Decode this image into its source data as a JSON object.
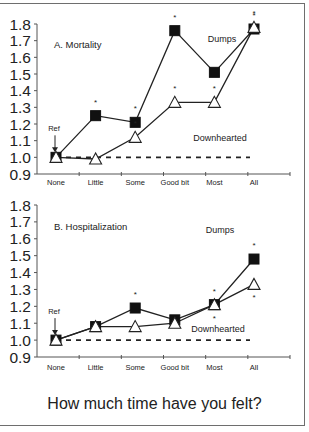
{
  "chart_data": [
    {
      "type": "line",
      "title": "A. Mortality",
      "categories": [
        "None",
        "Little",
        "Some",
        "Good bit",
        "Most",
        "All"
      ],
      "series": [
        {
          "name": "Dumps",
          "marker": "filled-square",
          "values": [
            1.0,
            1.25,
            1.21,
            1.76,
            1.51,
            1.77
          ],
          "significant": [
            false,
            true,
            true,
            true,
            false,
            true
          ]
        },
        {
          "name": "Downhearted",
          "marker": "open-triangle",
          "values": [
            1.0,
            0.99,
            1.12,
            1.33,
            1.33,
            1.78
          ],
          "significant": [
            false,
            false,
            true,
            true,
            true,
            true
          ]
        }
      ],
      "reference_line": 1.0,
      "reference_label": "Ref",
      "xlabel": "",
      "ylabel": "",
      "yticks": [
        "0.9",
        "1.0",
        "1.1",
        "1.2",
        "1.3",
        "1.4",
        "1.5",
        "1.6",
        "1.7",
        "1.8"
      ],
      "ylim": [
        0.9,
        1.8
      ],
      "annotations": [
        "Dumps",
        "Downhearted",
        "Ref"
      ],
      "grid": false
    },
    {
      "type": "line",
      "title": "B. Hospitalization",
      "categories": [
        "None",
        "Little",
        "Some",
        "Good bit",
        "Most",
        "All"
      ],
      "series": [
        {
          "name": "Dumps",
          "marker": "filled-square",
          "values": [
            1.0,
            1.08,
            1.19,
            1.12,
            1.21,
            1.48
          ],
          "significant": [
            false,
            false,
            true,
            false,
            true,
            true
          ]
        },
        {
          "name": "Downhearted",
          "marker": "open-triangle",
          "values": [
            1.0,
            1.08,
            1.08,
            1.1,
            1.21,
            1.33
          ],
          "significant": [
            false,
            false,
            false,
            false,
            true,
            true
          ]
        }
      ],
      "reference_line": 1.0,
      "reference_label": "Ref",
      "xlabel": "",
      "ylabel": "",
      "yticks": [
        "0.9",
        "1.0",
        "1.1",
        "1.2",
        "1.3",
        "1.4",
        "1.5",
        "1.6",
        "1.7",
        "1.8"
      ],
      "ylim": [
        0.9,
        1.8
      ],
      "annotations": [
        "Dumps",
        "Downhearted",
        "Ref"
      ],
      "grid": false
    }
  ],
  "footer": {
    "question": "How much time have you felt?"
  },
  "panels": {
    "a": {
      "title": "A. Mortality",
      "dumps_label": "Dumps",
      "downhearted_label": "Downhearted",
      "ref_label": "Ref"
    },
    "b": {
      "title": "B. Hospitalization",
      "dumps_label": "Dumps",
      "downhearted_label": "Downhearted",
      "ref_label": "Ref"
    }
  },
  "colors": {
    "line": "#222222",
    "marker_fill": "#111111",
    "frame": "#6e6e6e"
  }
}
